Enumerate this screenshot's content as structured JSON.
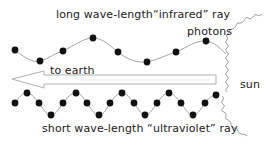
{
  "diagram": {
    "labels": {
      "infrared": "long wave-length“infrared” ray",
      "photons": "photons",
      "to_earth": "to earth",
      "sun": "sun",
      "ultraviolet": "short wave-length “ultraviolet” ray"
    },
    "colors": {
      "wave_line": "#9a9a9a",
      "photon_dot": "#111111",
      "arrow_outline": "#a8a8a8",
      "sun_squiggle": "#8a8a8a",
      "text": "#222222",
      "background": "#ffffff"
    },
    "waves": [
      {
        "name": "infrared",
        "wavelength": "long",
        "photon_count": 8
      },
      {
        "name": "ultraviolet",
        "wavelength": "short",
        "photon_count": 18
      }
    ],
    "arrow": {
      "direction": "left",
      "target": "earth"
    }
  }
}
